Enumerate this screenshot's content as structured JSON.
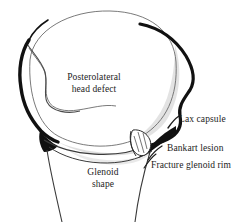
{
  "figure": {
    "background_color": "#ffffff",
    "ink_color": "#1c1c1c",
    "shading_color": "#d8d8d8",
    "labels": {
      "posterolateral_line1": "Posterolateral",
      "posterolateral_line2": "head defect",
      "lax_capsule": "Lax capsule",
      "bankart_lesion": "Bankart lesion",
      "fracture_glenoid_rim": "Fracture glenoid rim",
      "glenoid_line1": "Glenoid",
      "glenoid_line2": "shape"
    },
    "structures": [
      {
        "name": "humeral-head",
        "description": "large rounded humeral head outline"
      },
      {
        "name": "posterolateral-head-defect",
        "description": "notch indentation on left side of humeral head"
      },
      {
        "name": "lax-capsule",
        "description": "thick redundant capsule contour on right side"
      },
      {
        "name": "bankart-lesion",
        "description": "small detached labral fragment at inferior glenoid rim"
      },
      {
        "name": "fracture-glenoid-rim",
        "description": "bony fragment separated from glenoid rim"
      },
      {
        "name": "glenoid-shape",
        "description": "glenoid fossa and narrowing scapular neck"
      }
    ]
  }
}
